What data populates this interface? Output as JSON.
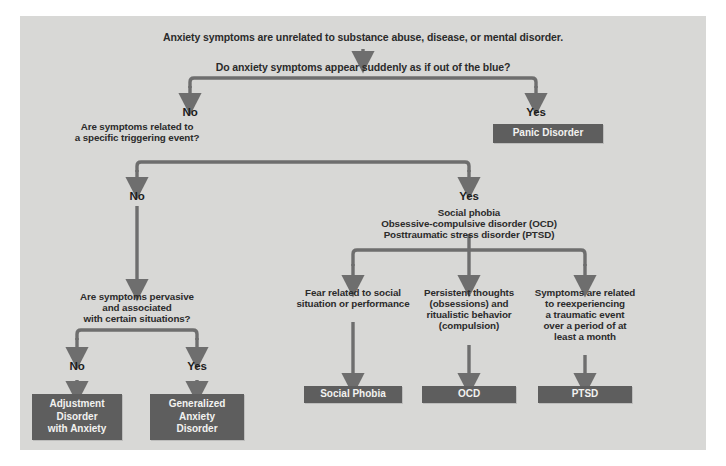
{
  "diagram": {
    "panel_color": "#d8d8d6",
    "wire_color": "#6e6e6e",
    "box_color": "#5e5e5e",
    "box_text_color": "#f2f2f0",
    "text_color": "#2b2b2b"
  },
  "nodes": {
    "root_statement": "Anxiety symptoms are unrelated to substance abuse, disease, or mental disorder.",
    "q1": "Do anxiety symptoms appear suddenly as if out of the blue?",
    "q1_no_label": "No",
    "q1_yes_label": "Yes",
    "q2": "Are symptoms related to\na specific triggering event?",
    "panic_box": "Panic Disorder",
    "q2_no_label": "No",
    "q2_yes_label": "Yes",
    "q2_yes_list": "Social phobia\nObsessive-compulsive disorder (OCD)\nPosttraumatic stress disorder (PTSD)",
    "q3": "Are symptoms pervasive\nand associated\nwith certain situations?",
    "q3_no_label": "No",
    "q3_yes_label": "Yes",
    "adjustment_box": "Adjustment\nDisorder\nwith Anxiety",
    "gad_box": "Generalized\nAnxiety\nDisorder",
    "branch_social": "Fear related to social\nsituation or performance",
    "branch_ocd": "Persistent thoughts\n(obsessions) and\nritualistic behavior\n(compulsion)",
    "branch_ptsd": "Symptoms are related\nto reexperiencing\na traumatic event\nover a period of at\nleast a month",
    "social_phobia_box": "Social Phobia",
    "ocd_box": "OCD",
    "ptsd_box": "PTSD"
  }
}
